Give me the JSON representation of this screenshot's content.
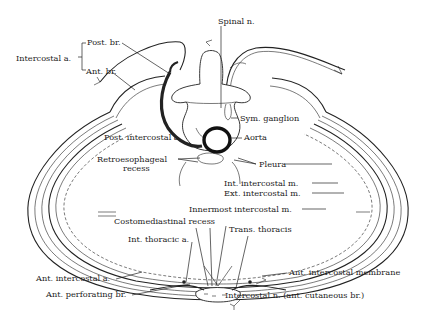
{
  "figure": {
    "labels": {
      "spinal_n": "Spinal n.",
      "intercostal_a": "Intercostal a.",
      "post_br": "Post. br.",
      "ant_br": "Ant. br.",
      "sym_ganglion": "Sym. ganglion",
      "post_intercostal_a": "Post. intercostal a.",
      "aorta": "Aorta",
      "retroesophageal_recess_1": "Retroesophageal",
      "retroesophageal_recess_2": "recess",
      "pleura": "Pleura",
      "int_intercostal_m": "Int. intercostal m.",
      "ext_intercostal_m": "Ext. intercostal m.",
      "innermost_intercostal_m": "Innermost intercostal m.",
      "costomediastinal_recess": "Costomediastinal recess",
      "trans_thoracis": "Trans. thoracis",
      "int_thoracic_a": "Int. thoracic a.",
      "ant_intercostal_a": "Ant. intercostal a.",
      "ant_intercostal_membrane": "Ant. intercostal membrane",
      "ant_perforating_br": "Ant. perforating br.",
      "intercostal_n_ant_cutaneous_br": "Intercostal n. (ant. cutaneous br.)"
    }
  }
}
